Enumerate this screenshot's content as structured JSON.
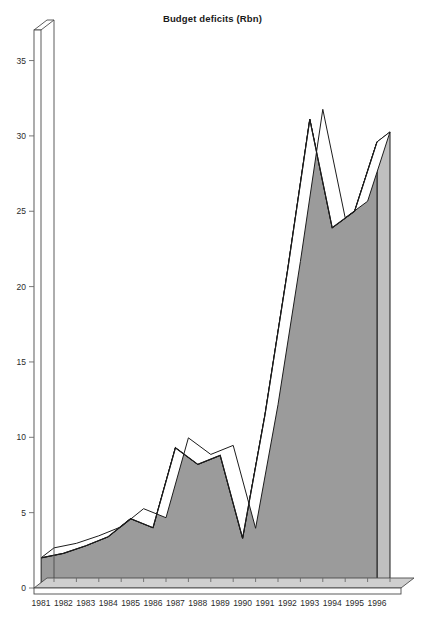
{
  "chart_data": {
    "type": "area",
    "title": "Budget deficits (Rbn)",
    "xlabel": "",
    "ylabel": "",
    "categories": [
      "1981",
      "1982",
      "1983",
      "1984",
      "1985",
      "1986",
      "1987",
      "1988",
      "1989",
      "1990",
      "1991",
      "1992",
      "1993",
      "1994",
      "1995",
      "1996"
    ],
    "values": [
      2.0,
      2.3,
      2.8,
      3.4,
      4.6,
      4.0,
      9.3,
      8.2,
      8.8,
      3.3,
      11.5,
      21.0,
      31.1,
      23.9,
      25.0,
      29.6
    ],
    "series": [
      {
        "name": "Budget deficits (Rbn)",
        "values": [
          2.0,
          2.3,
          2.8,
          3.4,
          4.6,
          4.0,
          9.3,
          8.2,
          8.8,
          3.3,
          11.5,
          21.0,
          31.1,
          23.9,
          25.0,
          29.6
        ]
      }
    ],
    "ylim": [
      0,
      37.5
    ],
    "xlim": [
      "1981",
      "1996"
    ],
    "y_ticks": [
      0,
      5,
      10,
      15,
      20,
      25,
      30,
      35
    ],
    "y_tick_labels": [
      "0",
      "5",
      "10",
      "15",
      "20",
      "25",
      "30",
      "35"
    ],
    "x_tick_labels": [
      "1981",
      "1982",
      "1983",
      "1984",
      "1985",
      "1986",
      "1987",
      "1988",
      "1989",
      "1990",
      "1991",
      "1992",
      "1993",
      "1994",
      "1995",
      "1996"
    ],
    "grid": false,
    "legend": null,
    "legend_position": "none",
    "style": "3d-extruded-area",
    "colors": {
      "fill": "#9b9b9b",
      "fill_top_face": "#a8a8a8",
      "outline": "#1c1c1c",
      "axis": "#555555",
      "text": "#2b2b2b",
      "background": "#ffffff",
      "highlight_edge": "#ffffff"
    },
    "annotations": []
  },
  "axes": {
    "y_axis_name": "value-axis",
    "x_axis_name": "year-axis"
  }
}
